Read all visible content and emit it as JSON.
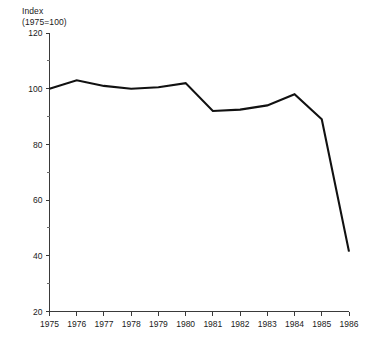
{
  "chart_data": {
    "type": "line",
    "title": "",
    "subtitle": "",
    "ylabel_line1": "Index",
    "ylabel_line2": "(1975=100)",
    "xlabel": "",
    "categories": [
      "1975",
      "1976",
      "1977",
      "1978",
      "1979",
      "1980",
      "1981",
      "1982",
      "1983",
      "1984",
      "1985",
      "1986"
    ],
    "x": [
      1975,
      1976,
      1977,
      1978,
      1979,
      1980,
      1981,
      1982,
      1983,
      1984,
      1985,
      1986
    ],
    "values": [
      100,
      103,
      101,
      100,
      100.5,
      102,
      92,
      92.5,
      94,
      98,
      89,
      41.5
    ],
    "series": [
      {
        "name": "Index (1975=100)",
        "values": [
          100,
          103,
          101,
          100,
          100.5,
          102,
          92,
          92.5,
          94,
          98,
          89,
          41.5
        ]
      }
    ],
    "ylim": [
      20,
      120
    ],
    "xlim": [
      1975,
      1986
    ],
    "ytick_labels": [
      "20",
      "40",
      "60",
      "80",
      "100",
      "120"
    ],
    "ytick_values": [
      20,
      40,
      60,
      80,
      100,
      120
    ],
    "yminor_values": [
      30,
      50,
      70,
      90,
      110
    ],
    "xtick_labels": [
      "1975",
      "1976",
      "1977",
      "1978",
      "1979",
      "1980",
      "1981",
      "1982",
      "1983",
      "1984",
      "1985",
      "1986"
    ],
    "grid": false,
    "legend": false,
    "legend_position": "none",
    "line_color": "#111111",
    "axis_color": "#3a3a3a",
    "background_color": "#ffffff"
  },
  "axis_title": {
    "line1": "Index",
    "line2": "(1975=100)"
  }
}
